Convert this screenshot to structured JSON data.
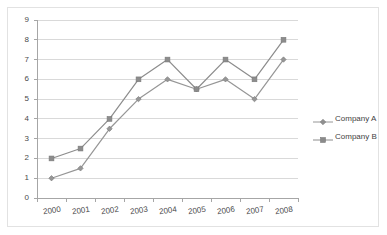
{
  "chart_data": {
    "type": "line",
    "title": "",
    "xlabel": "",
    "ylabel": "",
    "categories": [
      "2000",
      "2001",
      "2002",
      "2003",
      "2004",
      "2005",
      "2006",
      "2007",
      "2008"
    ],
    "series": [
      {
        "name": "Company A",
        "marker": "diamond",
        "color": "#969696",
        "values": [
          1,
          1.5,
          3.5,
          5,
          6,
          5.5,
          6,
          5,
          7
        ]
      },
      {
        "name": "Company B",
        "marker": "square",
        "color": "#8c8c8c",
        "values": [
          2,
          2.5,
          4,
          6,
          7,
          5.5,
          7,
          6,
          8
        ]
      }
    ],
    "ylim": [
      0,
      9
    ],
    "yticks": [
      "0",
      "1",
      "2",
      "3",
      "4",
      "5",
      "6",
      "7",
      "8",
      "9"
    ],
    "xticks": [
      "2000",
      "2001",
      "2002",
      "2003",
      "2004",
      "2005",
      "2006",
      "2007",
      "2008"
    ],
    "grid": "horizontal",
    "legend_position": "right",
    "axis_color": "#a6a6a6",
    "grid_color": "#d9d9d9",
    "tick_label_color": "#4a4a4a",
    "plot_background": "#ffffff",
    "border_color": "#e2e2e2"
  },
  "legend": {
    "entries": [
      {
        "label": "Company A"
      },
      {
        "label": "Company B"
      }
    ]
  }
}
